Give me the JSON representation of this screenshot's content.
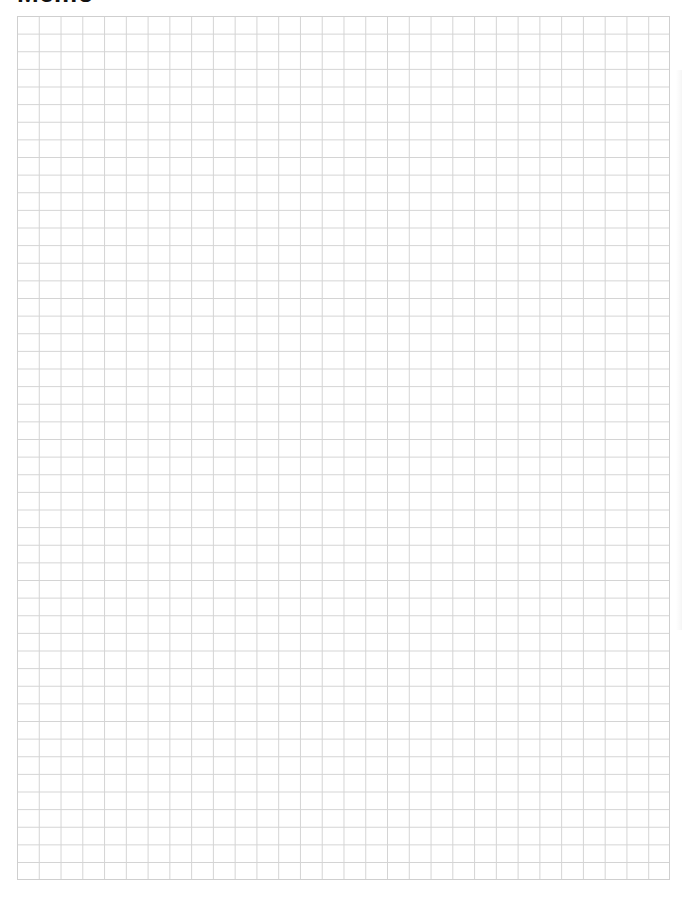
{
  "page": {
    "title": "Memo"
  },
  "grid": {
    "columns": 30,
    "rows": 49,
    "line_color": "#d4d4d4",
    "border_color": "#cfcfcf",
    "background": "#ffffff"
  }
}
